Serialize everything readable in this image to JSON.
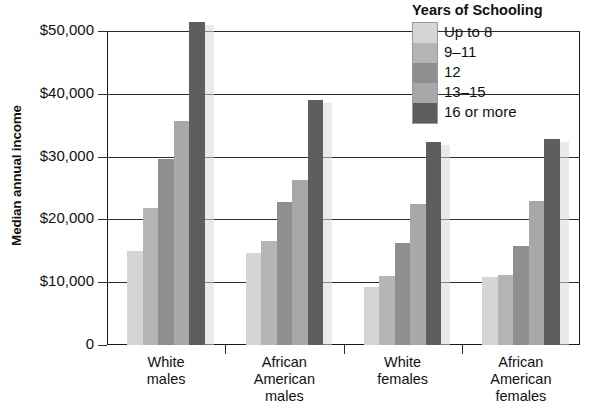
{
  "chart_data": {
    "type": "bar",
    "title": "",
    "xlabel": "",
    "ylabel": "Median annual income",
    "ylim": [
      0,
      53000
    ],
    "yticks": [
      0,
      10000,
      20000,
      30000,
      40000,
      50000
    ],
    "ytick_labels": [
      "0",
      "$10,000",
      "$20,000",
      "$30,000",
      "$40,000",
      "$50,000"
    ],
    "grid": true,
    "legend_position": "top-right",
    "legend_title": "Years of Schooling",
    "categories": [
      "White\nmales",
      "African\nAmerican\nmales",
      "White\nfemales",
      "African\nAmerican\nfemales"
    ],
    "series": [
      {
        "name": "Up to 8",
        "color": "#d5d5d5",
        "values": [
          15000,
          14700,
          9200,
          10900
        ]
      },
      {
        "name": "9–11",
        "color": "#b5b5b5",
        "values": [
          21800,
          16500,
          11000,
          11100
        ]
      },
      {
        "name": "12",
        "color": "#8f8f8f",
        "values": [
          29600,
          22800,
          16200,
          15800
        ]
      },
      {
        "name": "13–15",
        "color": "#a8a8a8",
        "values": [
          35600,
          26300,
          22400,
          22900
        ]
      },
      {
        "name": "16 or more",
        "color": "#5e5e5e",
        "values": [
          51500,
          39000,
          32400,
          32800
        ]
      }
    ]
  },
  "axis": {
    "y_title": "Median annual income"
  },
  "legend": {
    "title": "Years of Schooling",
    "entries": [
      {
        "label": "Up to 8"
      },
      {
        "label": "9–11"
      },
      {
        "label": "12"
      },
      {
        "label": "13–15"
      },
      {
        "label": "16 or more"
      }
    ]
  },
  "colors": {
    "axis": "#2b2b2b",
    "frame": "#1a1a1a",
    "background": "#ffffff"
  }
}
